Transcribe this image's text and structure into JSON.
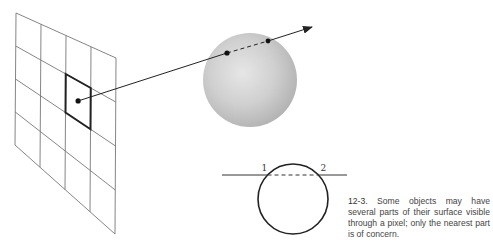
{
  "figure": {
    "grid": {
      "rows": 4,
      "cols": 4,
      "corners": {
        "top_left": [
          16,
          13
        ],
        "top_right": [
          116,
          58
        ],
        "bottom_right": [
          115,
          234
        ],
        "bottom_left": [
          15,
          145
        ]
      },
      "highlighted_cell": {
        "row": 1,
        "col": 2
      },
      "line_color": "#777777",
      "highlight_color": "#222222"
    },
    "ray": {
      "start": [
        72,
        97
      ],
      "end": [
        312,
        27
      ],
      "color": "#222222"
    },
    "sphere": {
      "center": [
        250,
        80
      ],
      "radius": 47,
      "fill_light": "#e4e4e4",
      "fill_dark": "#b5b5b5",
      "entry_point": [
        227,
        53
      ],
      "exit_point": [
        268,
        41
      ]
    },
    "cross_section": {
      "circle_center": [
        293,
        199
      ],
      "circle_radius": 35,
      "line_y": 175,
      "line_x_start": 222,
      "line_x_end": 347,
      "point_1_label": "1",
      "point_2_label": "2"
    }
  },
  "caption": {
    "number": "12-3.",
    "text": "Some objects may have several parts of their surface visible through a pixel; only the nearest part is of concern."
  }
}
